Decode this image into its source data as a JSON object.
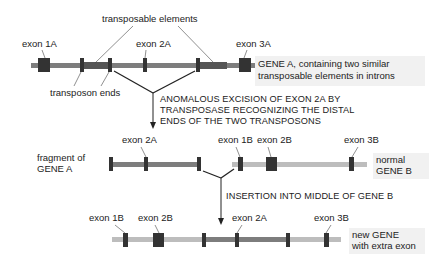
{
  "colors": {
    "gene_a_backbone": "#7d7d7d",
    "gene_b_backbone": "#bdbdbd",
    "transposon": "#555555",
    "exon": "#333333",
    "leader": "#444444",
    "arrow": "#222222",
    "label_bg": "#f1f1f1"
  },
  "gene_a": {
    "exon_labels": [
      "exon 1A",
      "exon 2A",
      "exon 3A"
    ],
    "transposable_elements_label": "transposable elements",
    "transposon_ends_label": "transposon ends",
    "description": [
      "GENE A, containing two similar",
      "transposable elements in introns"
    ]
  },
  "step1": {
    "caption": [
      "ANOMALOUS EXCISION OF EXON 2A BY",
      "TRANSPOSASE RECOGNIZING THE DISTAL",
      "ENDS OF THE TWO TRANSPOSONS"
    ]
  },
  "fragment": {
    "label": [
      "fragment of",
      "GENE A"
    ],
    "exon_label": "exon 2A"
  },
  "gene_b": {
    "exon_labels": [
      "exon 1B",
      "exon 2B",
      "exon 3B"
    ],
    "label": [
      "normal",
      "GENE B"
    ]
  },
  "step2": {
    "caption": "INSERTION INTO MIDDLE OF GENE B"
  },
  "new_gene": {
    "exon_labels": [
      "exon 1B",
      "exon 2B",
      "exon 2A",
      "exon 3B"
    ],
    "label": [
      "new GENE",
      "with extra exon"
    ]
  }
}
